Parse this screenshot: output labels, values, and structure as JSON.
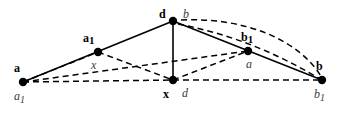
{
  "figure": {
    "kind": "geometry-diagram",
    "width": 356,
    "height": 113,
    "background_color": "#ffffff",
    "stroke_color": "#000000",
    "point_color": "#000000",
    "point_radius": 4.2,
    "solid_stroke_width": 1.6,
    "dashed_stroke_width": 1.5,
    "dash_pattern": "6,4"
  },
  "points": [
    {
      "id": "p-a",
      "name": "vertex-a",
      "x": 23,
      "y": 82,
      "bold_label": "a",
      "bold_sub": "",
      "italic_label": "a",
      "italic_sub": "1"
    },
    {
      "id": "p-a1",
      "name": "vertex-a1",
      "x": 98,
      "y": 52,
      "bold_label": "a",
      "bold_sub": "1",
      "italic_label": "x",
      "italic_sub": ""
    },
    {
      "id": "p-d-top",
      "name": "vertex-d-top",
      "x": 173,
      "y": 21,
      "bold_label": "d",
      "bold_sub": "",
      "italic_label": "b",
      "italic_sub": ""
    },
    {
      "id": "p-b1",
      "name": "vertex-b1",
      "x": 248,
      "y": 51,
      "bold_label": "b",
      "bold_sub": "1",
      "italic_label": "a",
      "italic_sub": ""
    },
    {
      "id": "p-b",
      "name": "vertex-b",
      "x": 322,
      "y": 80,
      "bold_label": "b",
      "bold_sub": "",
      "italic_label": "b",
      "italic_sub": "1"
    },
    {
      "id": "p-x-bottom",
      "name": "vertex-x-bottom",
      "x": 173,
      "y": 80,
      "bold_label": "x",
      "bold_sub": "",
      "italic_label": "d",
      "italic_sub": ""
    }
  ],
  "labels": [
    {
      "name": "label-a-bold",
      "text": "a",
      "sub": "",
      "style": "bold",
      "left": 14,
      "top": 62
    },
    {
      "name": "label-a1-italic",
      "text": "a",
      "sub": "1",
      "style": "italic",
      "left": 14,
      "top": 90
    },
    {
      "name": "label-a1-bold",
      "text": "a",
      "sub": "1",
      "style": "bold",
      "left": 83,
      "top": 32
    },
    {
      "name": "label-x-italic",
      "text": "x",
      "sub": "",
      "style": "italic",
      "left": 91,
      "top": 59
    },
    {
      "name": "label-d-bold",
      "text": "d",
      "sub": "",
      "style": "bold",
      "left": 159,
      "top": 8
    },
    {
      "name": "label-b-italic-top",
      "text": "b",
      "sub": "",
      "style": "italic",
      "left": 183,
      "top": 8
    },
    {
      "name": "label-b1-bold",
      "text": "b",
      "sub": "1",
      "style": "bold",
      "left": 241,
      "top": 31
    },
    {
      "name": "label-a-italic-mid",
      "text": "a",
      "sub": "",
      "style": "italic",
      "left": 246,
      "top": 58
    },
    {
      "name": "label-b-bold",
      "text": "b",
      "sub": "",
      "style": "bold",
      "left": 316,
      "top": 60
    },
    {
      "name": "label-b1-italic",
      "text": "b",
      "sub": "1",
      "style": "italic",
      "left": 314,
      "top": 88
    },
    {
      "name": "label-x-bold",
      "text": "x",
      "sub": "",
      "style": "bold",
      "left": 163,
      "top": 88
    },
    {
      "name": "label-d-italic",
      "text": "d",
      "sub": "",
      "style": "italic",
      "left": 182,
      "top": 87
    }
  ],
  "solid_segments": [
    {
      "name": "segment-a-to-top",
      "x1": 23,
      "y1": 82,
      "x2": 173,
      "y2": 21
    },
    {
      "name": "segment-top-to-b",
      "x1": 173,
      "y1": 21,
      "x2": 322,
      "y2": 80
    },
    {
      "name": "segment-top-to-xbottom",
      "x1": 173,
      "y1": 21,
      "x2": 173,
      "y2": 80
    }
  ],
  "dashed_segments": [
    {
      "name": "dashed-a-to-b1",
      "x1": 23,
      "y1": 82,
      "x2": 248,
      "y2": 51
    },
    {
      "name": "dashed-a-to-xbottom",
      "x1": 23,
      "y1": 82,
      "x2": 173,
      "y2": 80
    },
    {
      "name": "dashed-xbottom-to-b",
      "x1": 173,
      "y1": 80,
      "x2": 322,
      "y2": 80
    },
    {
      "name": "dashed-a1-to-xbottom",
      "x1": 98,
      "y1": 52,
      "x2": 173,
      "y2": 80
    },
    {
      "name": "dashed-a-to-a1",
      "x1": 23,
      "y1": 82,
      "x2": 98,
      "y2": 52
    },
    {
      "name": "dashed-xbottom-to-b1",
      "x1": 173,
      "y1": 80,
      "x2": 248,
      "y2": 51
    }
  ],
  "dashed_arcs": [
    {
      "name": "arc-top-to-b-outer",
      "path": "M 181 20 C 245 17 300 40 322 78"
    },
    {
      "name": "arc-top-to-b-inner",
      "path": "M 178 24 C 230 34 275 52 320 79"
    }
  ]
}
